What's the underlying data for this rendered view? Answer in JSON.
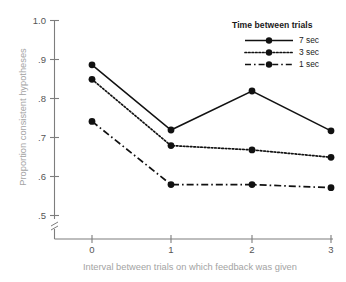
{
  "chart_data": {
    "type": "line",
    "title": "",
    "xlabel": "Interval between trials on which feedback was given",
    "ylabel": "Proportion consistent hypotheses",
    "x": [
      0,
      1,
      2,
      3
    ],
    "xticklabels": [
      "0",
      "1",
      "2",
      "3"
    ],
    "yticklabels": [
      "1.0",
      ".9",
      ".8",
      ".7",
      ".6",
      ".5"
    ],
    "ytickvalues": [
      1.0,
      0.9,
      0.8,
      0.7,
      0.6,
      0.5
    ],
    "xlim": [
      -0.45,
      3.3
    ],
    "ylim": [
      0.5,
      1.0
    ],
    "grid": false,
    "axis_break": true,
    "legend_position": "top-right",
    "legend_title": "Time between trials",
    "series": [
      {
        "name": "7 sec",
        "linestyle": "solid",
        "marker": "circle",
        "color": "#111111",
        "values": [
          0.885,
          0.718,
          0.818,
          0.716
        ]
      },
      {
        "name": "3 sec",
        "linestyle": "dotted",
        "marker": "circle",
        "color": "#111111",
        "values": [
          0.848,
          0.678,
          0.667,
          0.648
        ]
      },
      {
        "name": "1 sec",
        "linestyle": "dashdot",
        "marker": "circle",
        "color": "#111111",
        "values": [
          0.74,
          0.578,
          0.578,
          0.57
        ]
      }
    ]
  },
  "legend": {
    "title": "Time between trials",
    "items": [
      {
        "label": "7 sec"
      },
      {
        "label": "3 sec"
      },
      {
        "label": "1 sec"
      }
    ]
  },
  "axes": {
    "ylabel": "Proportion consistent hypotheses",
    "xlabel": "Interval between trials on which feedback was given",
    "yticks": [
      "1.0",
      ".9",
      ".8",
      ".7",
      ".6",
      ".5"
    ],
    "xticks": [
      "0",
      "1",
      "2",
      "3"
    ]
  },
  "colors": {
    "line": "#111111",
    "tick_text": "#555555",
    "axis_label_text": "#a3a3a3",
    "spine": "#7d7d7d",
    "background": "#ffffff"
  }
}
